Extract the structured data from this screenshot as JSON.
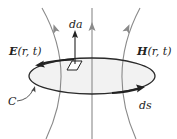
{
  "diagram": {
    "labels": {
      "e_field": "E",
      "e_args": "(r, t)",
      "e_arg_r": "r",
      "h_field": "H",
      "h_args": "(r, t)",
      "h_arg_r": "r",
      "area_element": "da",
      "line_element": "ds",
      "contour": "C"
    },
    "colors": {
      "field_lines": "#8a8a8a",
      "contour": "#2a2a2a",
      "surface_fill": "#f2f2f2",
      "text": "#222222"
    }
  }
}
